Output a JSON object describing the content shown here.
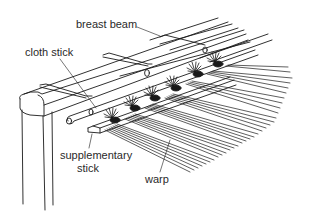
{
  "diagram": {
    "labels": {
      "breast_beam": "breast beam",
      "cloth_stick": "cloth stick",
      "supplementary_stick_line1": "supplementary",
      "supplementary_stick_line2": "stick",
      "warp": "warp"
    },
    "colors": {
      "line": "#1a1a1a",
      "text": "#2a2a2a",
      "background": "#ffffff"
    }
  }
}
